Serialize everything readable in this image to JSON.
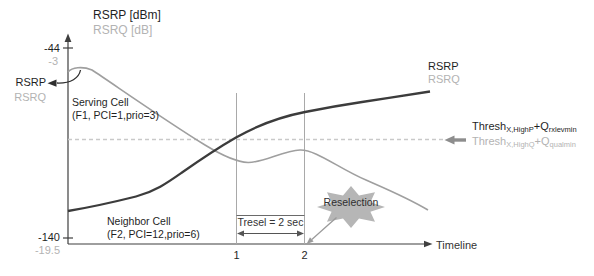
{
  "colors": {
    "text_dark": "#1f1f1f",
    "text_gray": "#b3b3b3",
    "curve_dark": "#3c3c3c",
    "curve_gray": "#9f9f9f",
    "dashed": "#c9c9c9",
    "guide": "#a9a9a9",
    "axis": "#3f3f3f",
    "star_fill": "#b6b6b6",
    "arrow_gray": "#8d8d8d",
    "annot_dark": "#2f2f2f"
  },
  "y_axis": {
    "title_rsrp": "RSRP [dBm]",
    "title_rsrq": "RSRQ [dB]",
    "top_tick_rsrp": "-44",
    "top_tick_rsrq": "-3",
    "bottom_tick_rsrp": "-140",
    "bottom_tick_rsrq": "-19.5"
  },
  "x_axis": {
    "label": "Timeline",
    "tick1": "1",
    "tick2": "2"
  },
  "pointer_labels": {
    "rsrp": "RSRP",
    "rsrq": "RSRQ"
  },
  "serving_cell": {
    "line1": "Serving Cell",
    "line2": "(F1, PCI=1,prio=3)"
  },
  "neighbor_cell": {
    "line1": "Neighbor Cell",
    "line2": "(F2, PCI=12,prio=6)"
  },
  "curve_labels": {
    "rsrp": "RSRP",
    "rsrq": "RSRQ"
  },
  "thresholds": {
    "rsrp": {
      "base": "Thresh",
      "sub1": "X,HighP",
      "plus": "+Q",
      "sub2": "rxlevmin"
    },
    "rsrq": {
      "base": "Thresh",
      "sub1": "X,HighQ",
      "plus": "+Q",
      "sub2": "qualmin"
    }
  },
  "tresel": {
    "label": "Tresel = 2 sec"
  },
  "reselection": {
    "label": "Reselection"
  }
}
